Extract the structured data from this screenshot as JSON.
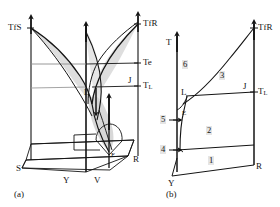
{
  "figure": {
    "type": "phase-diagram",
    "colors": {
      "line": "#141414",
      "surface_fill": "#d8d8d8",
      "surface_fill_light": "#e8e8e8",
      "background": "#ffffff",
      "label_halo": "#e1e1e1"
    }
  },
  "panel_a": {
    "caption": "(a)",
    "labels": {
      "tf_s": "TfS",
      "tf_r": "TfR",
      "te": "Te",
      "t_l": "T",
      "t_l_sub": "L",
      "j": "J",
      "l": "L",
      "e": "E",
      "s": "S",
      "y": "Y",
      "v": "V",
      "r": "R"
    }
  },
  "panel_b": {
    "caption": "(b)",
    "axis": {
      "t_axis": "T"
    },
    "labels": {
      "tf_r": "TfR",
      "t_l": "T",
      "t_l_sub": "L",
      "j": "J",
      "l": "L",
      "e": "E",
      "y": "Y",
      "r": "R"
    },
    "ticks": [
      {
        "label": "5"
      },
      {
        "label": "4"
      }
    ],
    "regions": [
      {
        "label": "1"
      },
      {
        "label": "2"
      },
      {
        "label": "3"
      },
      {
        "label": "6"
      }
    ]
  }
}
